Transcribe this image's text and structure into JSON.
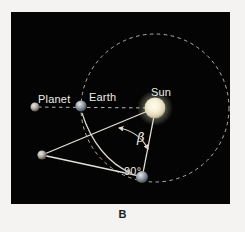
{
  "figure": {
    "panel_letter": "B",
    "background_color": "#f4f3f1",
    "sky_color": "#040404",
    "line_color": "#e8e6df",
    "orbit_color": "#bdbab2"
  },
  "labels": {
    "planet": "Planet",
    "earth": "Earth",
    "sun": "Sun",
    "beta": "β",
    "right_angle": "90°"
  },
  "diagram_data": {
    "type": "diagram",
    "title": "Planetary elongation geometry",
    "bodies": [
      {
        "name": "planet-far",
        "label": "Planet",
        "x": 24,
        "y": 95,
        "radius": 4.5,
        "color": "#c9c7c0"
      },
      {
        "name": "earth-opposition",
        "label": "Earth",
        "x": 70,
        "y": 94,
        "radius": 5.5,
        "color": "#a9b0bb"
      },
      {
        "name": "sun",
        "label": "Sun",
        "x": 144,
        "y": 96,
        "radius": 11,
        "color": "#f2ecd2"
      },
      {
        "name": "planet-vertex",
        "label": "",
        "x": 31,
        "y": 143,
        "radius": 4.5,
        "color": "#cbc9c2"
      },
      {
        "name": "earth-quadrature",
        "label": "Earth",
        "x": 131,
        "y": 165,
        "radius": 6,
        "color": "#b6b3ae"
      }
    ],
    "orbit": {
      "name": "earth-orbit",
      "center_x": 144,
      "center_y": 96,
      "radius": 74,
      "style": "dashed"
    },
    "sight_line": {
      "name": "opposition-sight-line",
      "from": [
        24,
        95
      ],
      "to": [
        144,
        96
      ],
      "style": "dashed"
    },
    "triangle": {
      "name": "elongation-triangle",
      "vertices": [
        [
          31,
          143
        ],
        [
          144,
          96
        ],
        [
          131,
          165
        ]
      ],
      "style": "solid"
    },
    "angles": [
      {
        "name": "beta-angle",
        "label": "β",
        "at_body": "sun",
        "value_deg": null
      },
      {
        "name": "right-angle",
        "label": "90°",
        "at_body": "earth-quadrature",
        "value_deg": 90
      }
    ],
    "motion_arrow": {
      "name": "earth-motion-arrow",
      "from": [
        70,
        94
      ],
      "to": [
        124,
        160
      ],
      "style": "curved-arrow"
    }
  }
}
